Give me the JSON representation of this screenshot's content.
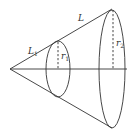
{
  "diagram": {
    "title": "",
    "type": "frustum-cone",
    "labels": {
      "L1": {
        "main": "L",
        "sub": "1"
      },
      "L": {
        "main": "L",
        "sub": ""
      },
      "r1": {
        "main": "r",
        "sub": "1"
      },
      "r2": {
        "main": "r",
        "sub": "2"
      }
    },
    "colors": {
      "stroke": "#333333",
      "background": "#ffffff"
    }
  }
}
